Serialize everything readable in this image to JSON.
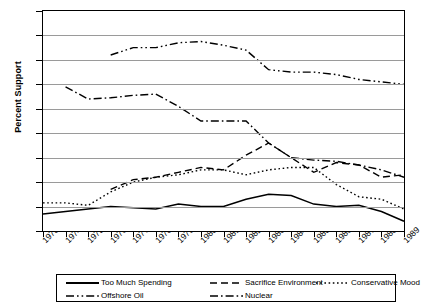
{
  "chart_data": {
    "type": "line",
    "title": "",
    "xlabel": "",
    "ylabel": "Percent Support",
    "xlim": [
      1973,
      1989
    ],
    "ylim": [
      0,
      90
    ],
    "ytick_step": 10,
    "grid": true,
    "legend_position": "bottom",
    "x": [
      1973,
      1974,
      1975,
      1976,
      1977,
      1978,
      1979,
      1980,
      1981,
      1982,
      1983,
      1984,
      1985,
      1986,
      1987,
      1988,
      1989
    ],
    "yticks": [
      "0",
      "10",
      "20",
      "30",
      "40",
      "50",
      "60",
      "70",
      "80",
      "90"
    ],
    "xticks": [
      "1973",
      "1974",
      "1975",
      "1976",
      "1977",
      "1978",
      "1979",
      "1980",
      "1981",
      "1982",
      "1983",
      "1984",
      "1985",
      "1986",
      "1987",
      "1988",
      "1989"
    ],
    "series": [
      {
        "name": "Too Much Spending",
        "style": "solid",
        "color": "#000000",
        "x": [
          1973,
          1974,
          1975,
          1976,
          1977,
          1978,
          1979,
          1980,
          1981,
          1982,
          1983,
          1984,
          1985,
          1986,
          1987,
          1988,
          1989
        ],
        "values": [
          7,
          8,
          9,
          10,
          9.5,
          9,
          11,
          10,
          10,
          13,
          15,
          14.5,
          11,
          10,
          10.5,
          8,
          4
        ]
      },
      {
        "name": "Sacrifice Environment",
        "style": "dashed",
        "color": "#000000",
        "x": [
          1974,
          1975,
          1976,
          1977,
          1978,
          1979,
          1980,
          1981,
          1982,
          1983,
          1984,
          1985,
          1986,
          1987,
          1988,
          1989
        ],
        "values": [
          null,
          null,
          17,
          21,
          22,
          24,
          26,
          25,
          31,
          36,
          30,
          24,
          28,
          27,
          22,
          23
        ]
      },
      {
        "name": "Conservative Mood",
        "style": "dotted",
        "color": "#000000",
        "x": [
          1973,
          1974,
          1975,
          1976,
          1977,
          1978,
          1979,
          1980,
          1981,
          1982,
          1983,
          1984,
          1985,
          1986,
          1987,
          1988,
          1989
        ],
        "values": [
          11.5,
          11.5,
          10.5,
          16,
          20,
          22,
          23,
          25,
          25,
          23,
          25,
          26,
          26,
          19,
          14,
          13,
          9
        ]
      },
      {
        "name": "Offshore Oil",
        "style": "dashdotdot",
        "color": "#000000",
        "x": [
          1976,
          1977,
          1978,
          1979,
          1980,
          1981,
          1982,
          1983,
          1984,
          1985,
          1986,
          1987,
          1988,
          1989
        ],
        "values": [
          72,
          75,
          75,
          77,
          77.5,
          76,
          74,
          66,
          65,
          65,
          64,
          62,
          61,
          60
        ]
      },
      {
        "name": "Nuclear",
        "style": "dashdot",
        "color": "#000000",
        "x": [
          1974,
          1975,
          1976,
          1977,
          1978,
          1979,
          1980,
          1981,
          1982,
          1983,
          1984,
          1985,
          1986,
          1987,
          1988,
          1989
        ],
        "values": [
          59,
          54,
          54.5,
          55.5,
          56,
          51,
          45,
          45,
          45,
          36,
          30,
          29,
          28.5,
          27,
          25,
          22
        ]
      }
    ],
    "legend_rows": [
      [
        {
          "label": "Too Much Spending",
          "style": "solid"
        },
        {
          "label": "Sacrifice Environment",
          "style": "dashed"
        },
        {
          "label": "Conservative Mood",
          "style": "dotted"
        }
      ],
      [
        {
          "label": "Offshore Oil",
          "style": "dashdotdot"
        },
        {
          "label": "Nuclear",
          "style": "dashdot"
        }
      ]
    ]
  }
}
